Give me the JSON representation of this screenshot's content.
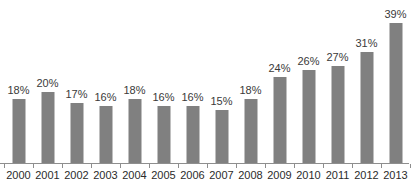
{
  "chart_data": {
    "type": "bar",
    "title": "",
    "subtitle": "",
    "xlabel": "",
    "ylabel": "",
    "categories": [
      "2000",
      "2001",
      "2002",
      "2003",
      "2004",
      "2005",
      "2006",
      "2007",
      "2008",
      "2009",
      "2010",
      "2011",
      "2012",
      "2013"
    ],
    "values": [
      18,
      20,
      17,
      16,
      18,
      16,
      16,
      15,
      18,
      24,
      26,
      27,
      31,
      39
    ],
    "data_labels": [
      "18%",
      "20%",
      "17%",
      "16%",
      "18%",
      "16%",
      "16%",
      "15%",
      "18%",
      "24%",
      "26%",
      "27%",
      "31%",
      "39%"
    ],
    "value_suffix": "%",
    "ylim": [
      0,
      39
    ],
    "grid": false,
    "legend": false,
    "legend_position": "none",
    "bar_color": "#808080",
    "axis_color": "#8e8e8e",
    "data_label_color": "#3a3a3a",
    "tick_label_color": "#2b2b2b",
    "background_color": "#ffffff"
  }
}
